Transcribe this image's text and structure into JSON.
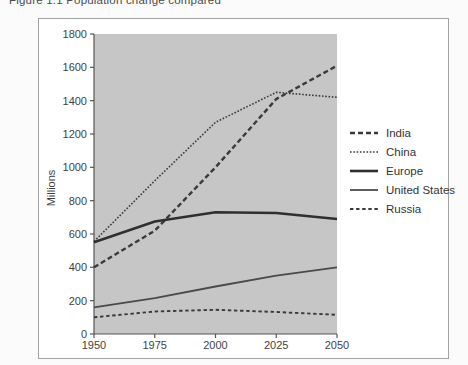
{
  "caption": "Figure 1.1 Population change compared",
  "chart_data": {
    "type": "line",
    "title": "Figure 1.1 Population change compared",
    "xlabel": "",
    "ylabel": "Millions",
    "ylim": [
      0,
      1800
    ],
    "yticks": [
      1800,
      1600,
      1400,
      1200,
      1000,
      800,
      600,
      400,
      200,
      0
    ],
    "x": [
      1950,
      1975,
      2000,
      2025,
      2050
    ],
    "series": [
      {
        "name": "India",
        "style": "dashed-bold",
        "color": "#3a3a3a",
        "values": [
          400,
          620,
          1000,
          1410,
          1610
        ]
      },
      {
        "name": "China",
        "style": "dotted",
        "color": "#3a3a3a",
        "values": [
          555,
          920,
          1270,
          1450,
          1420
        ]
      },
      {
        "name": "Europe",
        "style": "solid-thick",
        "color": "#2f2f2f",
        "values": [
          550,
          675,
          730,
          726,
          690
        ]
      },
      {
        "name": "United States",
        "style": "solid",
        "color": "#4a4a4a",
        "values": [
          160,
          215,
          285,
          350,
          400
        ]
      },
      {
        "name": "Russia",
        "style": "dashed",
        "color": "#3a3a3a",
        "values": [
          100,
          135,
          145,
          132,
          115
        ]
      }
    ],
    "legend_position": "right",
    "grid": false,
    "plot_bg": "#c6c6c6",
    "axis_color": "#555555",
    "frame_border_color": "#a3a3a3"
  }
}
